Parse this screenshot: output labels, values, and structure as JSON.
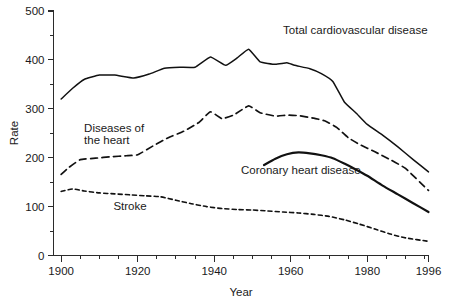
{
  "chart_data": {
    "type": "line",
    "title": "",
    "xlabel": "Year",
    "ylabel": "Rate",
    "xlim": [
      1898,
      1996
    ],
    "ylim": [
      0,
      500
    ],
    "grid": false,
    "legend_position": "inline-annotations",
    "x_ticks_major": [
      1900,
      1920,
      1940,
      1960,
      1980,
      1996
    ],
    "x_tick_labels": [
      "1900",
      "1920",
      "1940",
      "1960",
      "1980",
      "1996"
    ],
    "x_minor_step": 5,
    "y_ticks_major": [
      0,
      100,
      200,
      300,
      400,
      500
    ],
    "y_tick_labels": [
      "0",
      "100",
      "200",
      "300",
      "400",
      "500"
    ],
    "y_minor_step": 50,
    "series": [
      {
        "name": "Total cardiovascular disease",
        "style": "solid-thin",
        "label_x": 1958,
        "label_y": 452,
        "label_anchor": "start",
        "x": [
          1900,
          1903,
          1906,
          1910,
          1914,
          1919,
          1923,
          1927,
          1931,
          1935,
          1939,
          1943,
          1946,
          1949,
          1952,
          1956,
          1959,
          1961,
          1965,
          1968,
          1971,
          1974,
          1977,
          1980,
          1984,
          1988,
          1992,
          1996
        ],
        "y": [
          320,
          342,
          360,
          369,
          369,
          363,
          371,
          383,
          385,
          385,
          406,
          389,
          404,
          422,
          396,
          391,
          394,
          389,
          382,
          372,
          356,
          314,
          292,
          268,
          246,
          222,
          196,
          171
        ]
      },
      {
        "name": "Diseases of the heart",
        "style": "dashed-medium",
        "label_x": 1906,
        "label_y": 252,
        "label_anchor": "start",
        "label_line2_y": 228,
        "x": [
          1900,
          1902,
          1905,
          1909,
          1913,
          1917,
          1920,
          1924,
          1928,
          1932,
          1936,
          1939,
          1942,
          1945,
          1949,
          1952,
          1956,
          1959,
          1962,
          1966,
          1969,
          1972,
          1975,
          1978,
          1982,
          1986,
          1990,
          1996
        ],
        "y": [
          166,
          180,
          196,
          199,
          202,
          204,
          206,
          224,
          241,
          254,
          272,
          294,
          280,
          287,
          306,
          292,
          285,
          287,
          286,
          281,
          275,
          262,
          241,
          227,
          212,
          196,
          178,
          133
        ]
      },
      {
        "name": "Coronary heart disease",
        "style": "solid-thick",
        "label_x": 1947,
        "label_y": 166,
        "label_anchor": "start",
        "x": [
          1953,
          1956,
          1959,
          1962,
          1965,
          1968,
          1971,
          1974,
          1977,
          1980,
          1984,
          1988,
          1992,
          1996
        ],
        "y": [
          185,
          198,
          207,
          211,
          209,
          205,
          199,
          188,
          176,
          163,
          143,
          125,
          107,
          89
        ]
      },
      {
        "name": "Stroke",
        "style": "dashed-fine",
        "label_x": 1918,
        "label_y": 94,
        "label_anchor": "middle",
        "x": [
          1900,
          1903,
          1906,
          1910,
          1914,
          1918,
          1922,
          1926,
          1930,
          1934,
          1938,
          1942,
          1946,
          1950,
          1954,
          1958,
          1962,
          1966,
          1970,
          1974,
          1978,
          1982,
          1986,
          1990,
          1996
        ],
        "y": [
          131,
          136,
          132,
          128,
          126,
          124,
          122,
          120,
          113,
          106,
          100,
          96,
          94,
          93,
          91,
          89,
          87,
          84,
          80,
          73,
          64,
          54,
          44,
          36,
          29
        ]
      }
    ],
    "annotations": [
      {
        "text": "Total cardiovascular disease",
        "series": "Total cardiovascular disease"
      },
      {
        "text": "Diseases of",
        "series": "Diseases of the heart"
      },
      {
        "text": "the heart",
        "series": "Diseases of the heart"
      },
      {
        "text": "Coronary heart disease",
        "series": "Coronary heart disease"
      },
      {
        "text": "Stroke",
        "series": "Stroke"
      }
    ]
  },
  "labels": {
    "y_axis_title": "Rate",
    "x_axis_title": "Year",
    "total_cvd": "Total cardiovascular disease",
    "heart_line1": "Diseases of",
    "heart_line2": "the heart",
    "chd": "Coronary heart disease",
    "stroke": "Stroke"
  },
  "y_tick_text": {
    "t0": "0",
    "t100": "100",
    "t200": "200",
    "t300": "300",
    "t400": "400",
    "t500": "500"
  },
  "x_tick_text": {
    "t1900": "1900",
    "t1920": "1920",
    "t1940": "1940",
    "t1960": "1960",
    "t1980": "1980",
    "t1996": "1996"
  },
  "colors": {
    "line": "#111111",
    "axis": "#2b2b2b",
    "background": "#ffffff"
  }
}
